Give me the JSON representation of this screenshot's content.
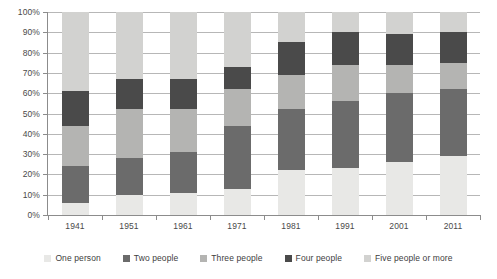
{
  "chart_data": {
    "type": "bar",
    "subtype": "stacked-percentage",
    "title": "",
    "xlabel": "",
    "ylabel": "",
    "ylim": [
      0,
      100
    ],
    "y_tick_labels": [
      "0%",
      "10%",
      "20%",
      "30%",
      "40%",
      "50%",
      "60%",
      "70%",
      "80%",
      "90%",
      "100%"
    ],
    "y_tick_values": [
      0,
      10,
      20,
      30,
      40,
      50,
      60,
      70,
      80,
      90,
      100
    ],
    "grid": true,
    "legend_position": "bottom",
    "categories": [
      "1941",
      "1951",
      "1961",
      "1971",
      "1981",
      "1991",
      "2001",
      "2011"
    ],
    "series": [
      {
        "name": "One person",
        "color": "#e8e8e6",
        "values": [
          6,
          10,
          11,
          13,
          22,
          23,
          26,
          29
        ]
      },
      {
        "name": "Two people",
        "color": "#6b6b6b",
        "values": [
          18,
          18,
          20,
          31,
          30,
          33,
          34,
          33
        ]
      },
      {
        "name": "Three people",
        "color": "#b4b4b2",
        "values": [
          20,
          24,
          21,
          18,
          17,
          18,
          14,
          13
        ]
      },
      {
        "name": "Four people",
        "color": "#4a4a4a",
        "values": [
          17,
          15,
          15,
          11,
          16,
          16,
          15,
          15
        ]
      },
      {
        "name": "Five people or more",
        "color": "#d2d2d0",
        "values": [
          39,
          33,
          33,
          27,
          15,
          10,
          11,
          10
        ]
      }
    ]
  },
  "legend": {
    "items": [
      {
        "label": "One person",
        "color": "#e8e8e6"
      },
      {
        "label": "Two people",
        "color": "#6b6b6b"
      },
      {
        "label": "Three people",
        "color": "#b4b4b2"
      },
      {
        "label": "Four people",
        "color": "#4a4a4a"
      },
      {
        "label": "Five people or more",
        "color": "#d2d2d0"
      }
    ]
  },
  "colors": {
    "gridline": "#b7b7b7",
    "axis": "#8c8c8c",
    "tick_text": "#4a4a4a",
    "legend_text": "#3d3d3d",
    "background": "#ffffff"
  }
}
